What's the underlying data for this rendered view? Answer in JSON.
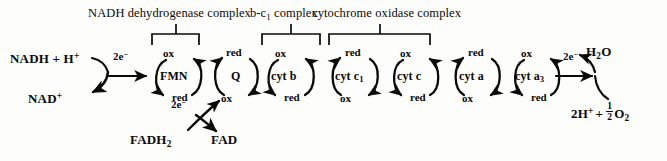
{
  "figure": {
    "background_color": "#fdfdfb",
    "ink_color": "#0a0a0a"
  },
  "complexes": [
    {
      "id": "nadh-dehydrogenase",
      "label": "NADH dehydrogenase complex",
      "bracket": {
        "x1": 152,
        "x2": 199,
        "stem_x": 176
      }
    },
    {
      "id": "b-c1",
      "label_prefix": "b-c",
      "label_subscript": "1",
      "label_suffix": " complex",
      "label_plain": "b-c1 complex",
      "bracket": {
        "x1": 262,
        "x2": 320,
        "stem_x": 291
      }
    },
    {
      "id": "cytochrome-oxidase",
      "label": "cytochrome oxidase complex",
      "bracket": {
        "x1": 329,
        "x2": 430,
        "stem_x": 380
      }
    }
  ],
  "carriers": [
    {
      "id": "fmn",
      "name": "FMN",
      "name_plain": "FMN",
      "top_state": "ox",
      "bottom_state": "red",
      "cx": 178,
      "cy": 76,
      "direction": "ox-top"
    },
    {
      "id": "q",
      "name": "Q",
      "name_plain": "Q",
      "top_state": "red",
      "bottom_state": "ox",
      "cx": 236,
      "cy": 76,
      "direction": "red-top"
    },
    {
      "id": "cyt-b",
      "name_prefix": "cyt b",
      "name_subscript": "",
      "name_plain": "cyt b",
      "top_state": "ox",
      "bottom_state": "red",
      "cx": 290,
      "cy": 76,
      "direction": "ox-top"
    },
    {
      "id": "cyt-c1",
      "name_prefix": "cyt c",
      "name_subscript": "1",
      "name_plain": "cyt c1",
      "top_state": "red",
      "bottom_state": "ox",
      "cx": 355,
      "cy": 76,
      "direction": "red-top"
    },
    {
      "id": "cyt-c",
      "name_prefix": "cyt c",
      "name_subscript": "",
      "name_plain": "cyt c",
      "top_state": "ox",
      "bottom_state": "red",
      "cx": 415,
      "cy": 76,
      "direction": "ox-top"
    },
    {
      "id": "cyt-a",
      "name_prefix": "cyt a",
      "name_subscript": "",
      "name_plain": "cyt a",
      "top_state": "red",
      "bottom_state": "ox",
      "cx": 477,
      "cy": 76,
      "direction": "red-top"
    },
    {
      "id": "cyt-a3",
      "name_prefix": "cyt a",
      "name_subscript": "3",
      "name_plain": "cyt a3",
      "top_state": "ox",
      "bottom_state": "red",
      "cx": 537,
      "cy": 76,
      "direction": "ox-top"
    }
  ],
  "substrates": {
    "nadh": {
      "base": "NADH + H",
      "superscript": "+",
      "plain": "NADH + H+"
    },
    "nad": {
      "base": "NAD",
      "superscript": "+",
      "plain": "NAD+"
    },
    "fadh2": {
      "base": "FADH",
      "subscript": "2",
      "plain": "FADH2"
    },
    "fad": {
      "plain": "FAD"
    },
    "water": {
      "base": "H",
      "subscript": "2",
      "suffix": "O",
      "plain": "H2O"
    },
    "oxygen": {
      "protons_base": "2H",
      "protons_superscript": "+",
      "plus": "+",
      "fraction_numerator": "1",
      "fraction_denominator": "2",
      "oxygen_base": "O",
      "oxygen_subscript": "2",
      "plain": "2H+ + 1/2 O2"
    }
  },
  "electron_labels": [
    {
      "id": "e-nadh",
      "base": "2e",
      "superscript": "−",
      "plain": "2e-",
      "x": 118,
      "y": 57
    },
    {
      "id": "e-fadh2",
      "base": "2e",
      "superscript": "−",
      "plain": "2e-",
      "x": 180,
      "y": 104
    },
    {
      "id": "e-oxygen",
      "base": "2e",
      "superscript": "−",
      "plain": "2e-",
      "x": 572,
      "y": 57
    }
  ]
}
